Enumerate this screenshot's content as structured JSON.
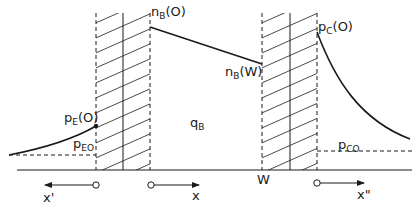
{
  "diagram": {
    "type": "minority-carrier-distribution",
    "labels": {
      "nB0": {
        "main": "n",
        "sub": "B",
        "tail": "(O)"
      },
      "nBW": {
        "main": "n",
        "sub": "B",
        "tail": "(W)"
      },
      "pE0": {
        "main": "p",
        "sub": "E",
        "tail": "(O)"
      },
      "pEO": {
        "main": "p",
        "sub": "EO",
        "tail": ""
      },
      "qB": {
        "main": "q",
        "sub": "B",
        "tail": ""
      },
      "pC0": {
        "main": "p",
        "sub": "C",
        "tail": "(O)"
      },
      "pCO": {
        "main": "p",
        "sub": "CO",
        "tail": ""
      },
      "W": "W",
      "x_prime": "x'",
      "x": "x",
      "x_double_prime": "x\""
    },
    "regions": [
      "emitter",
      "emitter-base depletion",
      "base",
      "base-collector depletion",
      "collector"
    ],
    "colors": {
      "ink": "#1a1a1a",
      "background": "#ffffff"
    }
  }
}
